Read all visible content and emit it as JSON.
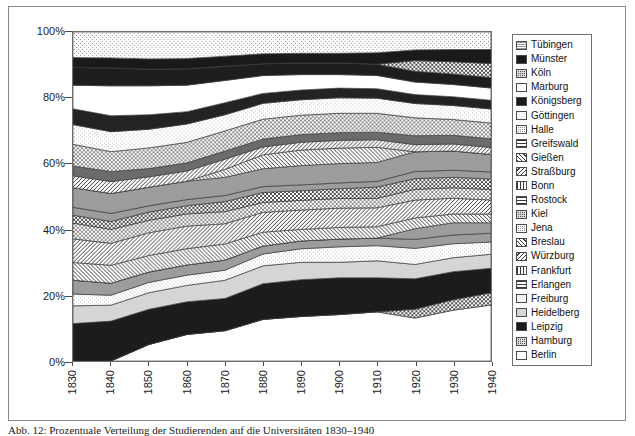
{
  "caption": "Abb. 12: Prozentuale Verteilung der Studierenden auf die Universitäten 1830–1940",
  "legend": {
    "position": "right",
    "items": [
      {
        "label": "Tübingen",
        "pattern": "dotted-light"
      },
      {
        "label": "Münster",
        "pattern": "solid-black"
      },
      {
        "label": "Köln",
        "pattern": "checker-dark"
      },
      {
        "label": "Marburg",
        "pattern": "solid-white"
      },
      {
        "label": "Königsberg",
        "pattern": "solid-black"
      },
      {
        "label": "Göttingen",
        "pattern": "dotted-faint"
      },
      {
        "label": "Halle",
        "pattern": "checker-mid"
      },
      {
        "label": "Greifswald",
        "pattern": "grid"
      },
      {
        "label": "Gießen",
        "pattern": "diag-fwd"
      },
      {
        "label": "Straßburg",
        "pattern": "diag-back"
      },
      {
        "label": "Bonn",
        "pattern": "vertical"
      },
      {
        "label": "Rostock",
        "pattern": "horizontal"
      },
      {
        "label": "Kiel",
        "pattern": "checker-dark"
      },
      {
        "label": "Jena",
        "pattern": "checker-mid"
      },
      {
        "label": "Breslau",
        "pattern": "diag-fwd"
      },
      {
        "label": "Würzburg",
        "pattern": "diag-back"
      },
      {
        "label": "Frankfurt",
        "pattern": "vertical"
      },
      {
        "label": "Erlangen",
        "pattern": "horizontal"
      },
      {
        "label": "Freiburg",
        "pattern": "dotted-faint"
      },
      {
        "label": "Heidelberg",
        "pattern": "solid-lightgrey"
      },
      {
        "label": "Leipzig",
        "pattern": "solid-black"
      },
      {
        "label": "Hamburg",
        "pattern": "checker-dark"
      },
      {
        "label": "Berlin",
        "pattern": "solid-white"
      }
    ]
  },
  "chart_data": {
    "type": "area",
    "stacked": true,
    "normalized": "100%",
    "title": "",
    "xlabel": "",
    "ylabel": "",
    "grid": false,
    "xlim": [
      1830,
      1940
    ],
    "ylim": [
      0,
      100
    ],
    "x": [
      1830,
      1840,
      1850,
      1860,
      1870,
      1880,
      1890,
      1900,
      1910,
      1920,
      1930,
      1940
    ],
    "xtick_labels": [
      "1830",
      "1840",
      "1850",
      "1860",
      "1870",
      "1880",
      "1890",
      "1900",
      "1910",
      "1920",
      "1930",
      "1940"
    ],
    "ytick_labels": [
      "0%",
      "20%",
      "40%",
      "60%",
      "80%",
      "100%"
    ],
    "ytick_values": [
      0,
      20,
      40,
      60,
      80,
      100
    ],
    "series": [
      {
        "name": "Berlin",
        "pattern": "solid-white",
        "fill": "#ffffff",
        "values": [
          0.0,
          0.0,
          4.0,
          6.5,
          7.5,
          10.5,
          11.5,
          12.0,
          13.0,
          12.0,
          14.5,
          16.0
        ]
      },
      {
        "name": "Hamburg",
        "pattern": "checker-dark",
        "fill": "#6b6b6b",
        "values": [
          0.0,
          0.0,
          0.0,
          0.0,
          0.0,
          0.0,
          0.0,
          0.0,
          0.0,
          2.5,
          3.0,
          3.5
        ]
      },
      {
        "name": "Leipzig",
        "pattern": "solid-black",
        "fill": "#1c1c1c",
        "values": [
          9.5,
          10.0,
          8.5,
          8.0,
          8.0,
          9.0,
          9.5,
          9.5,
          9.0,
          8.5,
          8.0,
          7.0
        ]
      },
      {
        "name": "Heidelberg",
        "pattern": "solid-lightgrey",
        "fill": "#d5d5d5",
        "values": [
          4.5,
          4.0,
          4.0,
          4.0,
          4.5,
          4.5,
          4.5,
          4.0,
          4.5,
          4.0,
          4.0,
          4.0
        ]
      },
      {
        "name": "Freiburg",
        "pattern": "dotted-faint",
        "fill": "#f0f0f0",
        "values": [
          3.0,
          2.5,
          2.5,
          2.5,
          2.5,
          3.0,
          3.5,
          4.0,
          4.0,
          4.5,
          4.0,
          3.5
        ]
      },
      {
        "name": "Erlangen",
        "pattern": "horizontal",
        "fill": "#c8c8c8",
        "values": [
          3.5,
          3.0,
          2.5,
          2.5,
          2.5,
          2.0,
          2.0,
          2.0,
          2.0,
          2.5,
          2.5,
          2.5
        ]
      },
      {
        "name": "Frankfurt",
        "pattern": "vertical",
        "fill": "#dcdcdc",
        "values": [
          0.0,
          0.0,
          0.0,
          0.0,
          0.0,
          0.0,
          0.0,
          0.0,
          0.0,
          3.0,
          3.5,
          3.0
        ]
      },
      {
        "name": "Würzburg",
        "pattern": "diag-back",
        "fill": "#b4b4b4",
        "values": [
          4.5,
          4.5,
          4.0,
          4.0,
          4.0,
          3.5,
          3.0,
          3.0,
          3.0,
          3.0,
          2.5,
          2.5
        ]
      },
      {
        "name": "Breslau",
        "pattern": "diag-fwd",
        "fill": "#a0a0a0",
        "values": [
          6.0,
          5.5,
          5.5,
          5.5,
          5.0,
          5.0,
          5.0,
          5.0,
          5.0,
          5.0,
          4.5,
          4.0
        ]
      },
      {
        "name": "Jena",
        "pattern": "checker-mid",
        "fill": "#9a9a9a",
        "values": [
          4.0,
          3.5,
          3.0,
          3.0,
          3.0,
          2.5,
          2.5,
          2.5,
          2.5,
          3.0,
          3.0,
          3.0
        ]
      },
      {
        "name": "Kiel",
        "pattern": "checker-dark",
        "fill": "#5e5e5e",
        "values": [
          2.0,
          2.0,
          2.0,
          2.0,
          2.5,
          2.5,
          2.5,
          2.5,
          3.0,
          3.0,
          3.0,
          3.0
        ]
      },
      {
        "name": "Rostock",
        "pattern": "horizontal",
        "fill": "#cfcfcf",
        "values": [
          2.0,
          2.0,
          1.5,
          1.5,
          1.5,
          1.5,
          1.5,
          1.5,
          1.5,
          2.0,
          2.0,
          2.0
        ]
      },
      {
        "name": "Bonn",
        "pattern": "vertical",
        "fill": "#e3e3e3",
        "values": [
          5.0,
          5.0,
          4.5,
          4.5,
          4.5,
          4.5,
          5.0,
          5.0,
          5.0,
          5.5,
          5.5,
          5.0
        ]
      },
      {
        "name": "Straßburg",
        "pattern": "diag-back",
        "fill": "#b8b8b8",
        "values": [
          0.0,
          0.0,
          0.0,
          0.0,
          2.0,
          3.5,
          4.0,
          4.0,
          4.0,
          0.0,
          0.0,
          0.0
        ]
      },
      {
        "name": "Gießen",
        "pattern": "diag-fwd",
        "fill": "#a8a8a8",
        "values": [
          3.0,
          3.0,
          2.5,
          2.5,
          2.5,
          2.0,
          2.0,
          2.0,
          2.0,
          2.0,
          2.0,
          2.0
        ]
      },
      {
        "name": "Greifswald",
        "pattern": "grid",
        "fill": "#d0d0d0",
        "values": [
          2.5,
          2.5,
          2.0,
          2.0,
          2.0,
          2.0,
          2.0,
          2.0,
          2.0,
          2.5,
          2.5,
          2.5
        ]
      },
      {
        "name": "Halle",
        "pattern": "checker-mid",
        "fill": "#9e9e9e",
        "values": [
          5.5,
          5.0,
          5.0,
          5.0,
          5.0,
          5.0,
          5.0,
          5.0,
          5.0,
          5.0,
          4.5,
          4.5
        ]
      },
      {
        "name": "Göttingen",
        "pattern": "dotted-faint",
        "fill": "#f2f2f2",
        "values": [
          5.0,
          5.0,
          4.5,
          4.5,
          4.0,
          4.0,
          4.0,
          4.0,
          4.0,
          4.0,
          4.0,
          4.0
        ]
      },
      {
        "name": "Königsberg",
        "pattern": "solid-black",
        "fill": "#232323",
        "values": [
          4.0,
          4.0,
          3.5,
          3.0,
          3.0,
          2.5,
          2.5,
          2.5,
          2.5,
          2.5,
          2.5,
          2.5
        ]
      },
      {
        "name": "Marburg",
        "pattern": "solid-white",
        "fill": "#ffffff",
        "values": [
          6.0,
          7.5,
          7.0,
          6.5,
          5.5,
          4.5,
          4.0,
          3.5,
          3.5,
          3.5,
          3.5,
          3.5
        ]
      },
      {
        "name": "Königsberg2",
        "pattern": "solid-black",
        "fill": "#1e1e1e",
        "values": [
          4.5,
          4.5,
          4.0,
          4.0,
          3.5,
          3.0,
          3.0,
          3.0,
          3.0,
          3.0,
          3.0,
          3.0
        ]
      },
      {
        "name": "Köln",
        "pattern": "checker-dark",
        "fill": "#707070",
        "values": [
          0.0,
          0.0,
          0.0,
          0.0,
          0.0,
          0.0,
          0.0,
          0.0,
          0.0,
          3.0,
          3.5,
          4.0
        ]
      },
      {
        "name": "Münster",
        "pattern": "solid-black",
        "fill": "#1a1a1a",
        "values": [
          2.5,
          2.5,
          2.5,
          2.5,
          2.5,
          2.5,
          2.5,
          2.5,
          3.0,
          3.0,
          3.5,
          4.0
        ]
      },
      {
        "name": "Tübingen",
        "pattern": "dotted-light",
        "fill": "#e8e8e8",
        "values": [
          6.5,
          6.5,
          6.5,
          6.5,
          6.0,
          5.5,
          5.5,
          5.5,
          5.5,
          5.0,
          5.0,
          5.0
        ]
      }
    ]
  }
}
